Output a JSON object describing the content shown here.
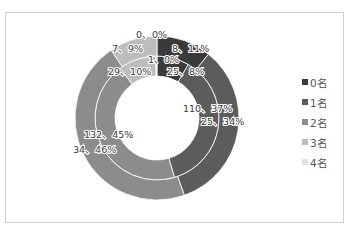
{
  "chart_data": {
    "type": "pie",
    "subtype": "double-donut",
    "title": "",
    "categories": [
      "0名",
      "1名",
      "2名",
      "3名",
      "4名"
    ],
    "colors": [
      "#3a3a3a",
      "#5c5c5c",
      "#8c8c8c",
      "#bdbdbd",
      "#e2e2e2"
    ],
    "series": [
      {
        "name": "inner",
        "values": [
          25,
          110,
          132,
          29,
          1
        ],
        "percents": [
          "8%",
          "37%",
          "45%",
          "10%",
          "0%"
        ],
        "labels": [
          "25、8%",
          "110、37%",
          "132、45%",
          "29、10%",
          "1、0%"
        ]
      },
      {
        "name": "outer",
        "values": [
          8,
          25,
          34,
          7,
          0
        ],
        "percents": [
          "11%",
          "34%",
          "46%",
          "9%",
          "0%"
        ],
        "labels": [
          "8、11%",
          "25、34%",
          "34、46%",
          "7、9%",
          "0、0%"
        ]
      }
    ],
    "legend_position": "right",
    "grid": false
  },
  "legend": {
    "items": [
      {
        "label": "0名",
        "color": "#3a3a3a"
      },
      {
        "label": "1名",
        "color": "#5c5c5c"
      },
      {
        "label": "2名",
        "color": "#8c8c8c"
      },
      {
        "label": "3名",
        "color": "#bdbdbd"
      },
      {
        "label": "4名",
        "color": "#e2e2e2"
      }
    ]
  }
}
